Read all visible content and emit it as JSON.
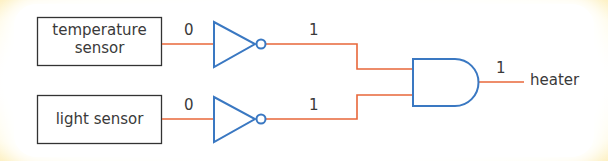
{
  "diagram": {
    "type": "logic-circuit",
    "colors": {
      "wire": "#e8673a",
      "gate": "#3a78c2",
      "box_border": "#333333",
      "text": "#3a3a3a",
      "background_glow": "#fdf0c0"
    },
    "inputs": [
      {
        "id": "temperature-sensor",
        "label_line1": "temperature",
        "label_line2": "sensor",
        "input_value": "0",
        "inverted_value": "1"
      },
      {
        "id": "light-sensor",
        "label_line1": "light sensor",
        "label_line2": "",
        "input_value": "0",
        "inverted_value": "1"
      }
    ],
    "gates": [
      {
        "id": "not-gate-1",
        "type": "NOT"
      },
      {
        "id": "not-gate-2",
        "type": "NOT"
      },
      {
        "id": "and-gate",
        "type": "AND"
      }
    ],
    "output": {
      "label": "heater",
      "value": "1"
    }
  }
}
